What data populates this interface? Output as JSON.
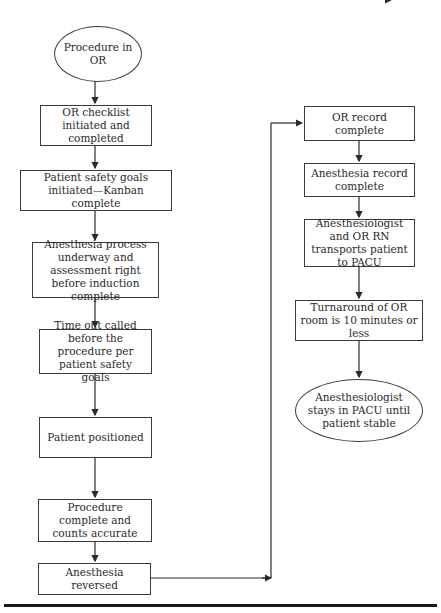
{
  "diagram": {
    "type": "flowchart",
    "nodes": [
      {
        "id": "n1",
        "shape": "ellipse",
        "label": "Procedure\nin OR"
      },
      {
        "id": "n2",
        "shape": "rect",
        "label": "OR checklist initiated\nand completed"
      },
      {
        "id": "n3",
        "shape": "rect",
        "label": "Patient safety goals initiated—\nKanban complete"
      },
      {
        "id": "n4",
        "shape": "rect",
        "label": "Anesthesia process\nunderway and assessment\nright before induction\ncomplete"
      },
      {
        "id": "n5",
        "shape": "rect",
        "label": "Time out called before\nthe procedure per\npatient safety goals"
      },
      {
        "id": "n6",
        "shape": "rect",
        "label": "Patient positioned"
      },
      {
        "id": "n7",
        "shape": "rect",
        "label": "Procedure complete\nand counts accurate"
      },
      {
        "id": "n8",
        "shape": "rect",
        "label": "Anesthesia reversed"
      },
      {
        "id": "n9",
        "shape": "rect",
        "label": "OR record complete"
      },
      {
        "id": "n10",
        "shape": "rect",
        "label": "Anesthesia record\ncomplete"
      },
      {
        "id": "n11",
        "shape": "rect",
        "label": "Anesthesiologist and\nOR RN transports\npatient to PACU"
      },
      {
        "id": "n12",
        "shape": "rect",
        "label": "Turnaround of OR room is\n10 minutes or less"
      },
      {
        "id": "n13",
        "shape": "ellipse",
        "label": "Anesthesiologist\nstays in PACU\nuntil patient stable"
      }
    ],
    "edges": [
      {
        "from": "n1",
        "to": "n2"
      },
      {
        "from": "n2",
        "to": "n3"
      },
      {
        "from": "n3",
        "to": "n4"
      },
      {
        "from": "n4",
        "to": "n5"
      },
      {
        "from": "n5",
        "to": "n6"
      },
      {
        "from": "n6",
        "to": "n7"
      },
      {
        "from": "n7",
        "to": "n8"
      },
      {
        "from": "n8",
        "to": "n9"
      },
      {
        "from": "n9",
        "to": "n10"
      },
      {
        "from": "n10",
        "to": "n11"
      },
      {
        "from": "n11",
        "to": "n12"
      },
      {
        "from": "n12",
        "to": "n13"
      }
    ]
  },
  "labels": {
    "n1": "Procedure in OR",
    "n2": "OR checklist initiated and completed",
    "n3": "Patient safety goals initiated—Kanban complete",
    "n4": "Anesthesia process underway and assessment right before induction complete",
    "n5": "Time out called before the procedure per patient safety goals",
    "n6": "Patient positioned",
    "n7": "Procedure complete and counts accurate",
    "n8": "Anesthesia reversed",
    "n9": "OR record complete",
    "n10": "Anesthesia record complete",
    "n11": "Anesthesiologist and OR RN transports patient to PACU",
    "n12": "Turnaround of OR room is 10 minutes or less",
    "n13": "Anesthesiologist stays in PACU until patient stable"
  },
  "colors": {
    "stroke": "#3a3a3a",
    "text": "#2a2a2a",
    "background": "#ffffff"
  }
}
